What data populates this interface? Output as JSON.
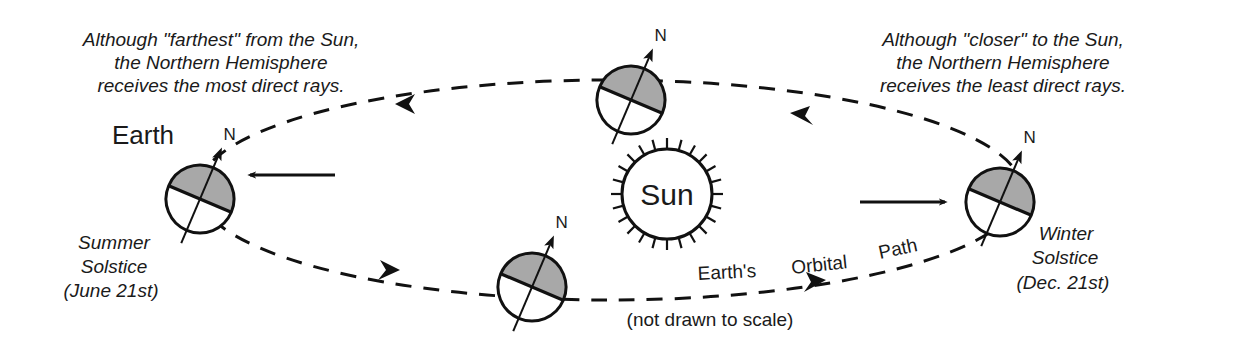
{
  "diagram": {
    "type": "earth-orbit-seasons",
    "colors": {
      "ink": "#111111",
      "hemisphere_shade": "#a8a8a8",
      "background": "#ffffff"
    },
    "sun": {
      "label": "Sun"
    },
    "earth_label": "Earth",
    "north_label": "N",
    "orbit_label": [
      "Earth's",
      "Orbital",
      "Path"
    ],
    "scale_note": "(not drawn to scale)",
    "summer": {
      "title_lines": [
        "Summer",
        "Solstice",
        "(June 21st)"
      ],
      "note_lines": [
        "Although \"farthest\" from the Sun,",
        "the Northern Hemisphere",
        "receives the most direct rays."
      ]
    },
    "winter": {
      "title_lines": [
        "Winter",
        "Solstice",
        "(Dec. 21st)"
      ],
      "note_lines": [
        "Although \"closer\" to the Sun,",
        "the Northern Hemisphere",
        "receives the least direct rays."
      ]
    },
    "earths": [
      {
        "name": "summer-solstice-earth"
      },
      {
        "name": "top-earth"
      },
      {
        "name": "bottom-earth"
      },
      {
        "name": "winter-solstice-earth"
      }
    ]
  }
}
